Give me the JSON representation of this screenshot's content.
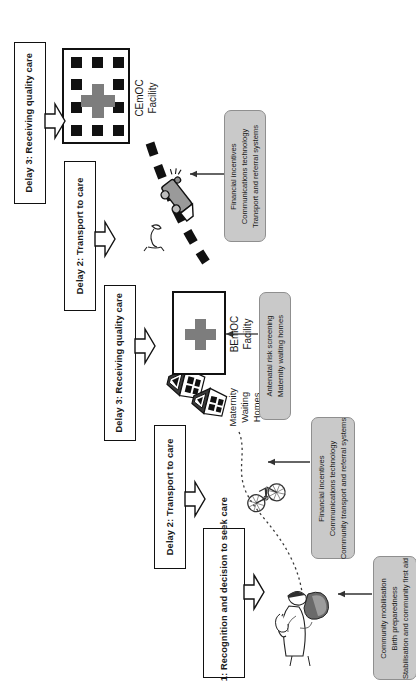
{
  "diagram": {
    "orientation": "rotated-90",
    "accent_grey": "#c9c9c9",
    "cross_grey": "#7d7d7d",
    "line_black": "#111111"
  },
  "delays": [
    {
      "id": "delay3-cemoc",
      "label": "Delay 3: Receiving quality care"
    },
    {
      "id": "delay2-ambulance",
      "label": "Delay 2: Transport to care"
    },
    {
      "id": "delay3-bemoc",
      "label": "Delay 3: Receiving quality care"
    },
    {
      "id": "delay2-community",
      "label": "Delay 2: Transport to care"
    },
    {
      "id": "delay1-recognition",
      "label": "Delay 1: Recognition and decision to seek care"
    }
  ],
  "interventions": [
    {
      "id": "cemoc-transport",
      "lines": [
        "Financial incentives",
        "Communications technology",
        "Transport and referral systems"
      ]
    },
    {
      "id": "bemoc-antenatal",
      "lines": [
        "Antenatal risk screening",
        "Maternity waiting homes"
      ]
    },
    {
      "id": "community-transport",
      "lines": [
        "Financial incentives",
        "Communications technology",
        "Community transport and referral systems"
      ]
    },
    {
      "id": "community-mobilisation",
      "lines": [
        "Community mobilisation",
        "Birth preparedness",
        "Stabilisation and community first aid"
      ]
    }
  ],
  "facilities": [
    {
      "id": "cemoc",
      "lines": [
        "CEmOC",
        "Facility"
      ]
    },
    {
      "id": "bemoc",
      "lines": [
        "BEmOC",
        "Facility"
      ]
    }
  ],
  "waiting_homes": {
    "lines": [
      "Maternity",
      "Waiting",
      "Homes"
    ]
  },
  "icons": {
    "cross": "medical-cross-icon",
    "ambulance": "ambulance-icon",
    "bicycle": "bicycle-icon",
    "house": "house-icon",
    "pregnant_woman": "pregnant-woman-icon",
    "person": "person-icon",
    "arrow": "arrow-left-icon",
    "road_dashed": "dashed-road-icon",
    "path_dotted": "dotted-path-icon"
  }
}
